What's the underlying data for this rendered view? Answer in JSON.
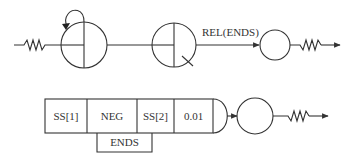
{
  "diagram": {
    "top_row": {
      "edge_label": "REL(ENDS)",
      "nodes": [
        {
          "id": "circle-1",
          "type": "quartered-circle-with-self-loop"
        },
        {
          "id": "circle-2",
          "type": "quartered-circle-with-tick"
        },
        {
          "id": "circle-3",
          "type": "empty-circle"
        }
      ],
      "input": "zigzag-input",
      "output": "zigzag-output-arrow"
    },
    "bottom_row": {
      "cells": [
        {
          "label": "SS[1]"
        },
        {
          "label": "NEG"
        },
        {
          "label": "SS[2]"
        },
        {
          "label": "0.01"
        }
      ],
      "sub_cell": {
        "label": "ENDS"
      },
      "nodes": [
        {
          "id": "circle-4",
          "type": "empty-circle"
        }
      ],
      "output": "zigzag-output-arrow"
    },
    "colors": {
      "stroke": "#333333",
      "background": "#ffffff"
    }
  }
}
